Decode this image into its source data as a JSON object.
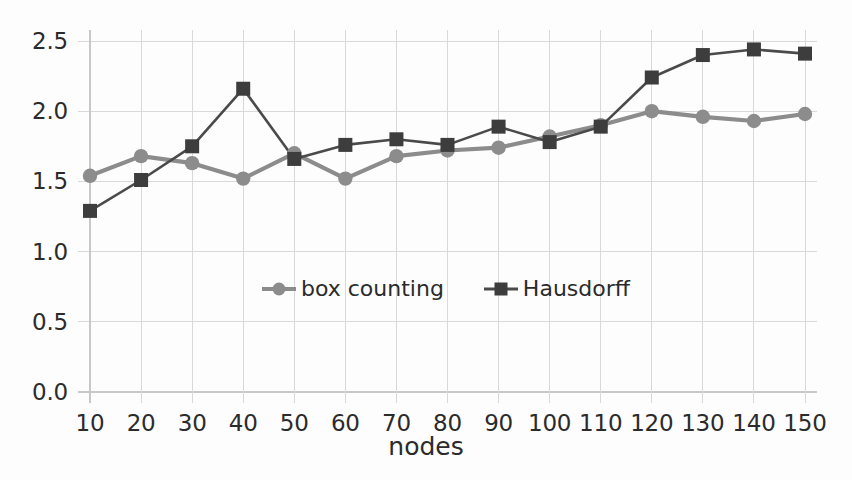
{
  "chart_data": {
    "type": "line",
    "title": "",
    "xlabel": "nodes",
    "ylabel": "",
    "categories": [
      10,
      20,
      30,
      40,
      50,
      60,
      70,
      80,
      90,
      100,
      110,
      120,
      130,
      140,
      150
    ],
    "x_tick_labels": [
      "10",
      "20",
      "30",
      "40",
      "50",
      "60",
      "70",
      "80",
      "90",
      "100",
      "110",
      "120",
      "130",
      "140",
      "150"
    ],
    "y_tick_labels": [
      "0.0",
      "0.5",
      "1.0",
      "1.5",
      "2.0",
      "2.5"
    ],
    "y_tick_values": [
      0.0,
      0.5,
      1.0,
      1.5,
      2.0,
      2.5
    ],
    "xlim": [
      10,
      150
    ],
    "ylim": [
      0.0,
      2.5
    ],
    "grid": true,
    "legend_position": "center",
    "series": [
      {
        "name": "box counting",
        "color": "#8c8c8c",
        "marker": "circle",
        "values": [
          1.54,
          1.68,
          1.63,
          1.52,
          1.7,
          1.52,
          1.68,
          1.72,
          1.74,
          1.82,
          1.9,
          2.0,
          1.96,
          1.93,
          1.98
        ]
      },
      {
        "name": "Hausdorff",
        "color": "#3d3d3d",
        "marker": "square",
        "values": [
          1.29,
          1.51,
          1.75,
          2.16,
          1.66,
          1.76,
          1.8,
          1.76,
          1.89,
          1.78,
          1.89,
          2.24,
          2.4,
          2.44,
          2.41
        ]
      }
    ]
  }
}
